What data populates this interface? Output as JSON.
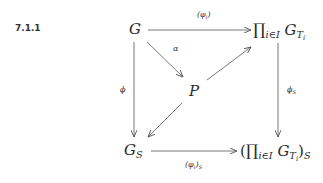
{
  "equation_number": "7.1.1",
  "nodes": {
    "G": "G",
    "P": "P",
    "prod": {
      "symbol": "∏",
      "index": "i∈I",
      "base": "G",
      "sub": "T",
      "subsub": "i"
    },
    "GS": {
      "base": "G",
      "sub": "S"
    },
    "prodS": {
      "open": "(",
      "symbol": "∏",
      "index": "i∈I",
      "base": "G",
      "sub": "T",
      "subsub": "i",
      "close": ")",
      "outer_sub": "S"
    }
  },
  "arrows": {
    "top": {
      "label": "(φ",
      "label_sub": "i",
      "label_close": ")"
    },
    "alpha": {
      "label": "α"
    },
    "left": {
      "label": "ϕ"
    },
    "right": {
      "label": "ϕ",
      "label_sub": "S"
    },
    "bottom": {
      "label": "(φ",
      "label_sub": "i",
      "label_close": ")",
      "label_outer_sub": "S"
    }
  }
}
